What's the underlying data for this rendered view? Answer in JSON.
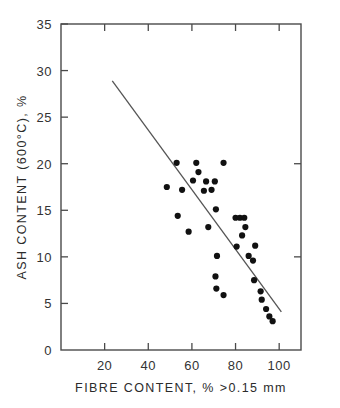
{
  "chart_data": {
    "type": "scatter",
    "title": "",
    "xlabel": "FIBRE  CONTENT,  %   >0.15 mm",
    "ylabel": "ASH  CONTENT  (600°C),  %",
    "xlim": [
      0,
      110
    ],
    "ylim": [
      0,
      35
    ],
    "xticks": [
      20,
      40,
      60,
      80,
      100
    ],
    "yticks": [
      0,
      5,
      10,
      15,
      20,
      25,
      30,
      35
    ],
    "xtick_labels": [
      "20",
      "40",
      "60",
      "80",
      "100"
    ],
    "ytick_labels": [
      "0",
      "5",
      "10",
      "15",
      "20",
      "25",
      "30",
      "35"
    ],
    "grid": false,
    "legend": null,
    "marker": "filled-circle",
    "marker_color": "#111111",
    "points": [
      {
        "x": 48.5,
        "y": 17.5
      },
      {
        "x": 53.0,
        "y": 20.1
      },
      {
        "x": 53.5,
        "y": 14.4
      },
      {
        "x": 55.5,
        "y": 17.2
      },
      {
        "x": 58.5,
        "y": 12.7
      },
      {
        "x": 60.5,
        "y": 18.2
      },
      {
        "x": 62.0,
        "y": 20.1
      },
      {
        "x": 63.0,
        "y": 19.1
      },
      {
        "x": 65.5,
        "y": 17.1
      },
      {
        "x": 66.5,
        "y": 18.1
      },
      {
        "x": 67.5,
        "y": 13.2
      },
      {
        "x": 69.0,
        "y": 17.2
      },
      {
        "x": 70.5,
        "y": 18.1
      },
      {
        "x": 71.0,
        "y": 15.1
      },
      {
        "x": 70.8,
        "y": 7.9
      },
      {
        "x": 71.5,
        "y": 10.1
      },
      {
        "x": 71.2,
        "y": 6.6
      },
      {
        "x": 74.5,
        "y": 20.1
      },
      {
        "x": 74.5,
        "y": 5.9
      },
      {
        "x": 80.0,
        "y": 14.2
      },
      {
        "x": 82.0,
        "y": 14.2
      },
      {
        "x": 84.0,
        "y": 14.2
      },
      {
        "x": 80.5,
        "y": 11.1
      },
      {
        "x": 83.0,
        "y": 12.3
      },
      {
        "x": 84.5,
        "y": 13.2
      },
      {
        "x": 86.0,
        "y": 10.1
      },
      {
        "x": 88.0,
        "y": 9.6
      },
      {
        "x": 89.0,
        "y": 11.2
      },
      {
        "x": 88.5,
        "y": 7.5
      },
      {
        "x": 91.5,
        "y": 6.3
      },
      {
        "x": 92.0,
        "y": 5.4
      },
      {
        "x": 94.0,
        "y": 4.4
      },
      {
        "x": 95.5,
        "y": 3.6
      },
      {
        "x": 97.0,
        "y": 3.1
      }
    ],
    "fit_line": {
      "x_start": 23.5,
      "y_start": 28.9,
      "x_end": 101.0,
      "y_end": 4.1,
      "color": "#555555"
    }
  },
  "axes": {
    "x_axis_name": "fibre-content-axis",
    "y_axis_name": "ash-content-axis"
  }
}
